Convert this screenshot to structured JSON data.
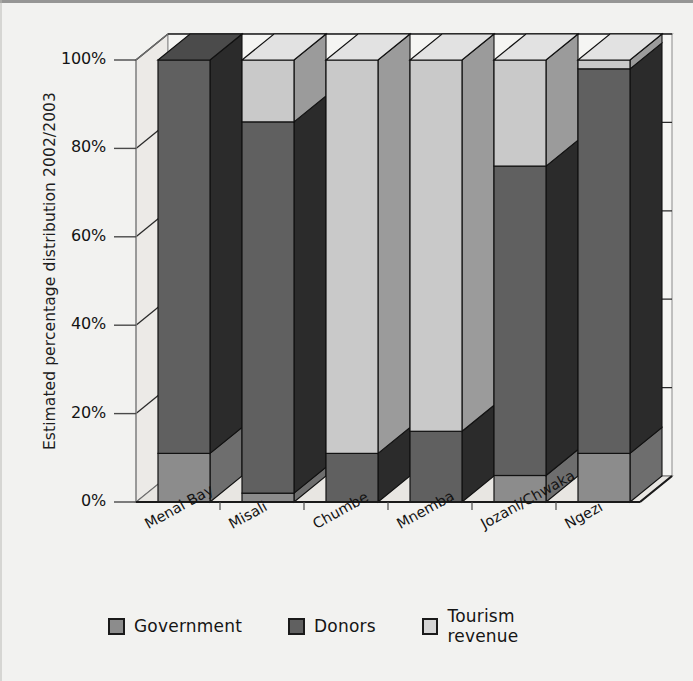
{
  "chart_data": {
    "type": "bar",
    "subtype": "stacked-column-3d-100percent",
    "title": "",
    "xlabel": "",
    "ylabel": "Estimated percentage distribution 2002/2003",
    "ylim": [
      0,
      100
    ],
    "ytick_labels": [
      "0%",
      "20%",
      "40%",
      "60%",
      "80%",
      "100%"
    ],
    "ytick_values": [
      0,
      20,
      40,
      60,
      80,
      100
    ],
    "grid": true,
    "legend_position": "bottom",
    "categories": [
      "Menai Bay",
      "Misali",
      "Chumbe",
      "Mnemba",
      "Jozani/Chwaka",
      "Ngezi"
    ],
    "series": [
      {
        "name": "Government",
        "color": "#8c8c8c",
        "values": [
          11,
          2,
          0,
          0,
          6,
          11
        ]
      },
      {
        "name": "Donors",
        "color": "#606060",
        "values": [
          89,
          84,
          11,
          16,
          70,
          87
        ]
      },
      {
        "name": "Tourism revenue",
        "color": "#c9c9c9",
        "values": [
          0,
          14,
          89,
          84,
          24,
          2
        ]
      }
    ]
  },
  "axis": {
    "y_title": "Estimated percentage distribution 2002/2003",
    "y_ticks": [
      "100%",
      "80%",
      "60%",
      "40%",
      "20%",
      "0%"
    ],
    "x_labels": [
      "Menai Bay",
      "Misali",
      "Chumbe",
      "Mnemba",
      "Jozani/Chwaka",
      "Ngezi"
    ]
  },
  "legend": {
    "items": [
      {
        "label": "Government",
        "color": "#8c8c8c",
        "swatch": "legend-swatch-government"
      },
      {
        "label": "Donors",
        "color": "#606060",
        "swatch": "legend-swatch-donors"
      },
      {
        "label": "Tourism revenue",
        "color": "#d5d5d5",
        "swatch": "legend-swatch-tourism"
      }
    ]
  },
  "colors": {
    "government": "#8c8c8c",
    "donors": "#606060",
    "tourism": "#cccccc",
    "side_shade_government": "#6e6e6e",
    "side_shade_donors": "#2b2b2b",
    "side_shade_tourism": "#9b9b9b",
    "top_government": "#9d9d9d",
    "top_donors": "#4b4b4b",
    "top_tourism": "#e2e2e2",
    "plot_background": "#f5f5f3",
    "page_background": "#f2f2f0",
    "axis_line": "#1a1a1a",
    "grid_line": "#2a2a2a",
    "wall_left": "#eceae7",
    "floor": "#e8e6e2"
  }
}
